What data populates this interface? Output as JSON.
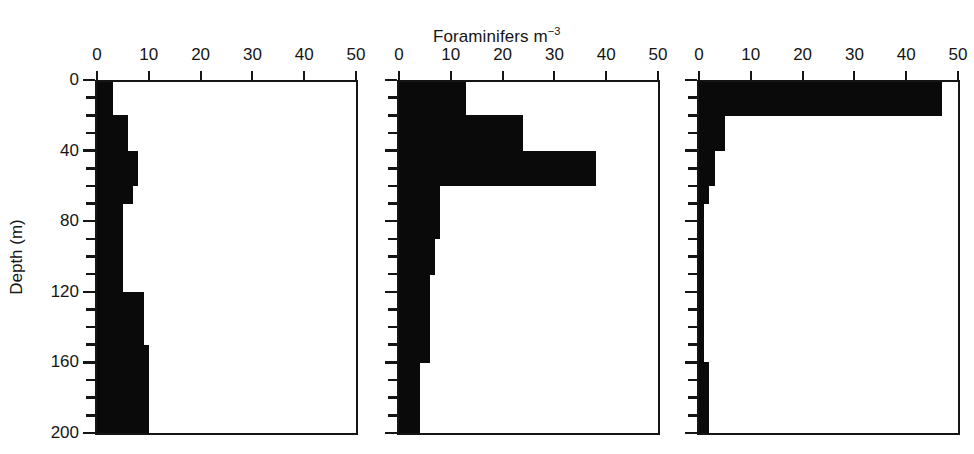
{
  "figure": {
    "title_text": "Foraminifers m",
    "title_superscript": "−3",
    "title_full": "Foraminifers m−3",
    "background_color": "#ffffff",
    "ink_color": "#0a0a0a",
    "y_axis_title": "Depth (m)"
  },
  "chart_data": {
    "type": "bar",
    "orientation": "horizontal-depth-profile",
    "title": "Foraminifers m−3",
    "xlabel": "Foraminifers m−3",
    "ylabel": "Depth (m)",
    "xlim": [
      0,
      50
    ],
    "ylim": [
      0,
      200
    ],
    "y_inverted": true,
    "grid": false,
    "legend": "none",
    "x_tick_labels": [
      "0",
      "10",
      "20",
      "30",
      "40",
      "50"
    ],
    "x_tick_values": [
      0,
      10,
      20,
      30,
      40,
      50
    ],
    "y_tick_labels_major": [
      "0",
      "40",
      "80",
      "120",
      "160",
      "200"
    ],
    "y_tick_values_major": [
      0,
      40,
      80,
      120,
      160,
      200
    ],
    "y_tick_values_minor": [
      10,
      20,
      30,
      50,
      60,
      70,
      90,
      100,
      110,
      130,
      140,
      150,
      170,
      180,
      190
    ],
    "bin_size_m": 10,
    "depth_bins": [
      [
        0,
        10
      ],
      [
        10,
        20
      ],
      [
        20,
        30
      ],
      [
        30,
        40
      ],
      [
        40,
        50
      ],
      [
        50,
        60
      ],
      [
        60,
        70
      ],
      [
        70,
        80
      ],
      [
        80,
        90
      ],
      [
        90,
        100
      ],
      [
        100,
        110
      ],
      [
        110,
        120
      ],
      [
        120,
        130
      ],
      [
        130,
        140
      ],
      [
        140,
        150
      ],
      [
        150,
        160
      ],
      [
        160,
        170
      ],
      [
        170,
        180
      ],
      [
        180,
        190
      ],
      [
        190,
        200
      ]
    ],
    "panels": [
      {
        "id": "panel-1",
        "index": 1,
        "values": [
          3,
          3,
          6,
          6,
          8,
          8,
          7,
          5,
          5,
          5,
          5,
          5,
          9,
          9,
          9,
          10,
          10,
          10,
          10,
          10
        ],
        "show_y_axis_labels": true
      },
      {
        "id": "panel-2",
        "index": 2,
        "values": [
          13,
          13,
          24,
          24,
          38,
          38,
          8,
          8,
          8,
          7,
          7,
          6,
          6,
          6,
          6,
          6,
          4,
          4,
          4,
          4
        ],
        "show_y_axis_labels": false
      },
      {
        "id": "panel-3",
        "index": 3,
        "values": [
          47,
          47,
          5,
          5,
          3,
          3,
          2,
          1,
          1,
          1,
          1,
          1,
          1,
          1,
          1,
          1,
          2,
          2,
          2,
          2
        ],
        "show_y_axis_labels": false
      }
    ]
  }
}
